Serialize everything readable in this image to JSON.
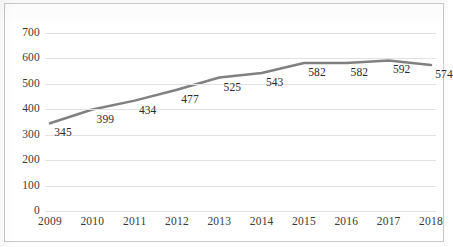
{
  "chart_data": {
    "type": "line",
    "title": "",
    "subtitle": "",
    "xlabel": "",
    "ylabel": "",
    "categories": [
      "2009",
      "2010",
      "2011",
      "2012",
      "2013",
      "2014",
      "2015",
      "2016",
      "2017",
      "2018"
    ],
    "series": [
      {
        "name": "",
        "values": [
          345,
          399,
          434,
          477,
          525,
          543,
          582,
          582,
          592,
          574
        ],
        "color": "#808080",
        "line_width": 2.5,
        "markers": false,
        "data_labels": [
          "345",
          "399",
          "434",
          "477",
          "525",
          "543",
          "582",
          "582",
          "592",
          "574"
        ]
      }
    ],
    "ylim": [
      0,
      700
    ],
    "ytick_values": [
      0,
      100,
      200,
      300,
      400,
      500,
      600,
      700
    ],
    "ytick_labels": [
      "0",
      "100",
      "200",
      "300",
      "400",
      "500",
      "600",
      "700"
    ],
    "xtick_labels": [
      "2009",
      "2010",
      "2011",
      "2012",
      "2013",
      "2014",
      "2015",
      "2016",
      "2017",
      "2018"
    ],
    "grid": {
      "horizontal": true,
      "vertical": false,
      "color": "#e2e2e2"
    },
    "legend": {
      "visible": false,
      "position": "none",
      "entries": []
    },
    "axis_line_color": "#d0d0d0",
    "plot_background": "#ffffff",
    "border_color": "#c9c9c9",
    "label_text_color": "#3a3a3a",
    "data_label_color": "#2b2b2b"
  }
}
